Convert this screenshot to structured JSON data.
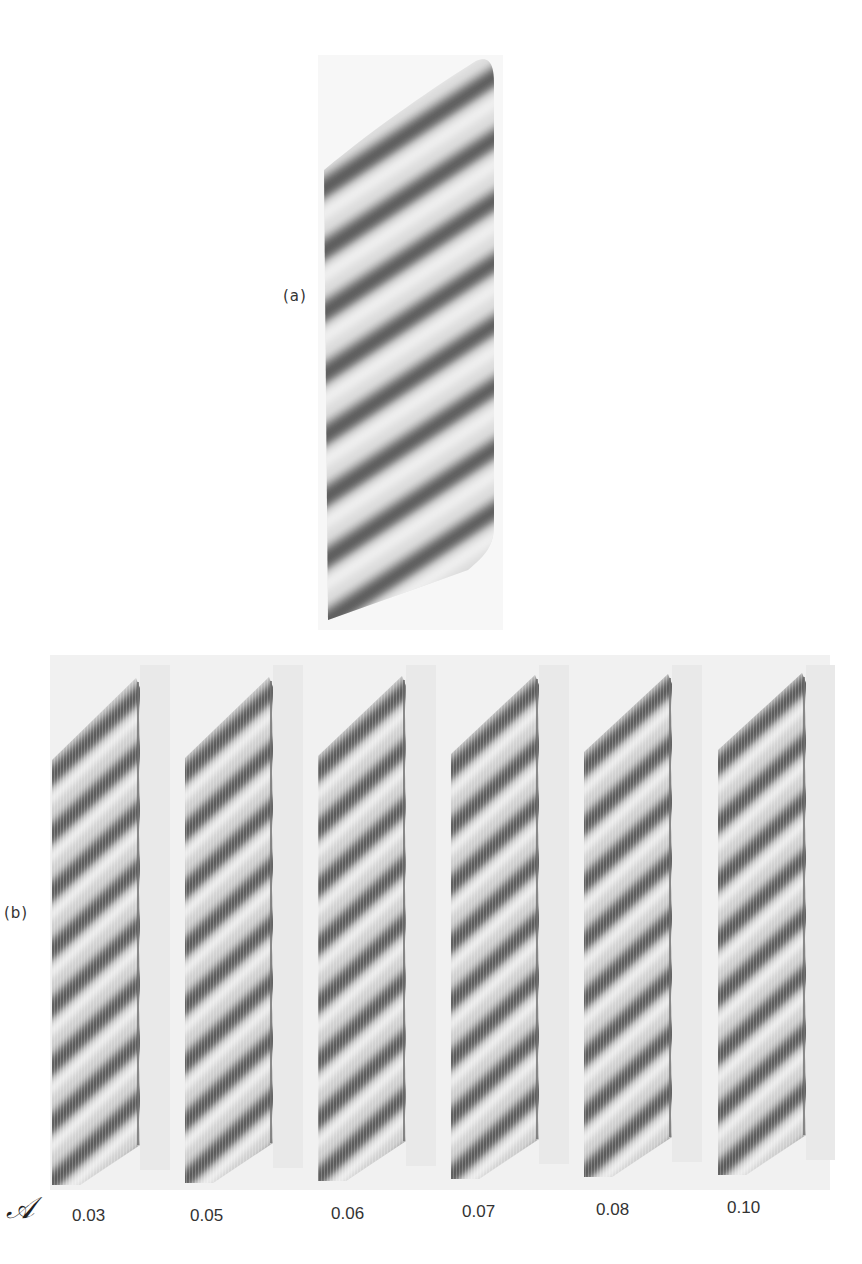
{
  "figure": {
    "panel_a": {
      "label": "(a)",
      "description": "experimental stripe pattern",
      "stripe_count": 9
    },
    "panel_b": {
      "label": "(b)",
      "description": "simulated stripe patterns for varying parameter",
      "parameter_symbol": "𝒜",
      "stripe_count": 8,
      "values": [
        "0.03",
        "0.05",
        "0.06",
        "0.07",
        "0.08",
        "0.10"
      ]
    },
    "colors": {
      "background": "#ffffff",
      "dark_stripe": "#5a5a5a",
      "light_stripe": "#e8e8e8",
      "band_background": "#efefef"
    }
  }
}
